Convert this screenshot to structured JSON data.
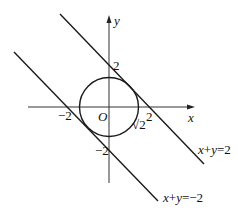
{
  "diagram": {
    "axes": {
      "x_label": "x",
      "y_label": "y",
      "origin_label": "O"
    },
    "ticks": {
      "x_pos": "2",
      "x_neg": "−2",
      "y_pos": "2",
      "y_neg": "−2"
    },
    "circle": {
      "center": [
        0,
        0
      ],
      "radius_label": "√2",
      "radius_value": 1.4142
    },
    "lines": [
      {
        "equation": "x+y=2",
        "label_x": "x",
        "label_plus": "+",
        "label_y": "y",
        "label_rhs": "=2"
      },
      {
        "equation": "x+y=−2",
        "label_x": "x",
        "label_plus": "+",
        "label_y": "y",
        "label_rhs": "=−2"
      }
    ],
    "stroke_color": "#1a1a1a"
  }
}
